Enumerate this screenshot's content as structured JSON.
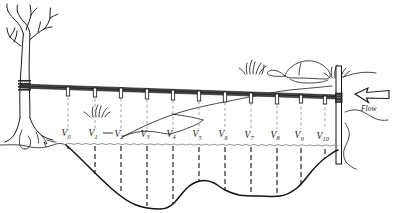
{
  "figure": {
    "type": "technical-line-diagram",
    "width": 401,
    "height": 213,
    "background_color": "#ffffff",
    "ink_color": "#1a1a1a",
    "water_line_color": "#8c8c8c",
    "upper_dash_color": "#9a9a9a",
    "cable_color": "#4a4a4a"
  },
  "flow": {
    "label": "Flow",
    "direction": "left",
    "arrow_style": "hollow-outline-arrow"
  },
  "verticals": [
    {
      "id": "v0",
      "label": "V",
      "subscript": "0",
      "x": 68,
      "cable_y": 87,
      "water_y": 144,
      "bed_y": 149
    },
    {
      "id": "v1",
      "label": "V",
      "subscript": "1",
      "x": 95,
      "cable_y": 88,
      "water_y": 144,
      "bed_y": 175
    },
    {
      "id": "v2",
      "label": "V",
      "subscript": "2",
      "x": 121,
      "cable_y": 88,
      "water_y": 145,
      "bed_y": 190
    },
    {
      "id": "v3",
      "label": "V",
      "subscript": "3",
      "x": 147,
      "cable_y": 89,
      "water_y": 145,
      "bed_y": 203
    },
    {
      "id": "v4",
      "label": "V",
      "subscript": "4",
      "x": 173,
      "cable_y": 90,
      "water_y": 145,
      "bed_y": 208
    },
    {
      "id": "v5",
      "label": "V",
      "subscript": "5",
      "x": 199,
      "cable_y": 91,
      "water_y": 145,
      "bed_y": 196
    },
    {
      "id": "v6",
      "label": "V",
      "subscript": "6",
      "x": 225,
      "cable_y": 92,
      "water_y": 146,
      "bed_y": 191
    },
    {
      "id": "v7",
      "label": "V",
      "subscript": "7",
      "x": 251,
      "cable_y": 93,
      "water_y": 146,
      "bed_y": 196
    },
    {
      "id": "v8",
      "label": "V",
      "subscript": "8",
      "x": 277,
      "cable_y": 95,
      "water_y": 147,
      "bed_y": 197
    },
    {
      "id": "v9",
      "label": "V",
      "subscript": "9",
      "x": 301,
      "cable_y": 96,
      "water_y": 147,
      "bed_y": 186
    },
    {
      "id": "v10",
      "label": "V",
      "subscript": "10",
      "x": 325,
      "cable_y": 97,
      "water_y": 148,
      "bed_y": 160
    }
  ],
  "span_indicator": {
    "from": "V1",
    "to": "V2",
    "note": "horizontal spacing tie-line drawn between the V1 and V2 labels"
  },
  "scene": {
    "left_anchor": "tree",
    "right_anchor": "post",
    "tree": {
      "description": "bare deciduous tree with exposed roots on left bank"
    },
    "post": {
      "description": "vertical cableway post on right bank"
    },
    "cable": {
      "description": "taut cableway spanning the channel with hanger tick marks"
    },
    "far_bank_line": {
      "description": "far bank terrain line rising left to right"
    },
    "boulder": {
      "description": "rock on far bank right of centre"
    },
    "grass_tufts": [
      {
        "location": "near-V1-above-water"
      },
      {
        "location": "far-bank-left-of-boulder"
      },
      {
        "location": "far-bank-right-of-boulder"
      }
    ],
    "water_surface": {
      "description": "wavy water surface line across the channel"
    },
    "stream_bed": {
      "description": "irregular channel bed profile, deepest near V4"
    }
  }
}
